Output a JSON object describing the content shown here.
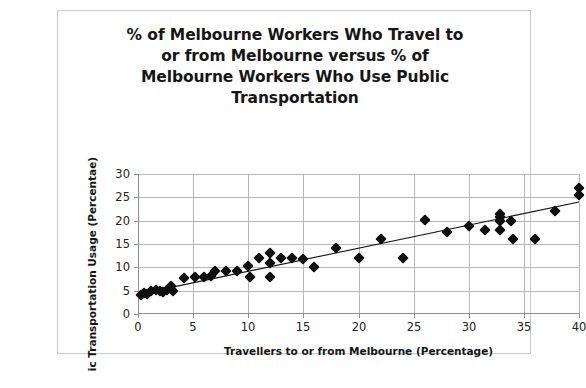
{
  "chart_data": {
    "type": "scatter",
    "title": "% of Melbourne Workers Who Travel to or from Melbourne versus % of Melbourne Workers Who Use Public Transportation",
    "title_lines": [
      "% of Melbourne Workers Who Travel to",
      "or from Melbourne versus % of",
      "Melbourne Workers Who Use Public",
      "Transportation"
    ],
    "xlabel": "Travellers to or from Melbourne (Percentage)",
    "ylabel": "ic Transportation Usage (Percentae)",
    "ylabel_full_visible": "ic Transportation Usage (Percentae)",
    "xlim": [
      0,
      40
    ],
    "ylim": [
      0,
      30
    ],
    "xticks": [
      0,
      5,
      10,
      15,
      20,
      25,
      30,
      35,
      40
    ],
    "yticks": [
      0,
      5,
      10,
      15,
      20,
      25,
      30
    ],
    "grid": "both",
    "legend": "none",
    "marker_shape": "diamond",
    "marker_color": "#0f0f0f",
    "trendline_color": "#111111",
    "frame_color": "#c9c9c9",
    "gridline_color": "#b7b7b7",
    "background": "#ffffff",
    "points": [
      [
        0.3,
        4.0
      ],
      [
        0.5,
        4.5
      ],
      [
        0.8,
        4.2
      ],
      [
        1.2,
        5.0
      ],
      [
        1.6,
        5.2
      ],
      [
        2.0,
        5.0
      ],
      [
        2.3,
        4.7
      ],
      [
        2.6,
        5.2
      ],
      [
        3.0,
        6.0
      ],
      [
        3.2,
        5.0
      ],
      [
        4.2,
        7.8
      ],
      [
        5.2,
        8.0
      ],
      [
        6.0,
        8.0
      ],
      [
        6.6,
        8.2
      ],
      [
        7.0,
        9.2
      ],
      [
        8.0,
        9.2
      ],
      [
        9.0,
        9.2
      ],
      [
        10.0,
        10.2
      ],
      [
        10.2,
        8.0
      ],
      [
        11.0,
        12.0
      ],
      [
        12.0,
        13.0
      ],
      [
        12.0,
        11.0
      ],
      [
        12.0,
        8.0
      ],
      [
        13.0,
        12.0
      ],
      [
        14.0,
        12.0
      ],
      [
        15.0,
        11.8
      ],
      [
        16.0,
        10.0
      ],
      [
        18.0,
        14.2
      ],
      [
        20.0,
        12.0
      ],
      [
        22.0,
        16.0
      ],
      [
        24.0,
        12.0
      ],
      [
        26.0,
        20.2
      ],
      [
        28.0,
        17.5
      ],
      [
        30.0,
        18.8
      ],
      [
        31.5,
        18.0
      ],
      [
        32.8,
        21.5
      ],
      [
        32.8,
        20.8
      ],
      [
        32.8,
        20.0
      ],
      [
        32.8,
        18.0
      ],
      [
        33.8,
        20.0
      ],
      [
        34.0,
        16.0
      ],
      [
        36.0,
        16.0
      ],
      [
        37.8,
        22.0
      ],
      [
        40.0,
        27.0
      ],
      [
        40.0,
        25.5
      ]
    ],
    "trendline": {
      "type": "linear",
      "x_start": 0,
      "y_start": 4.2,
      "x_end": 40,
      "y_end": 24.0
    }
  }
}
